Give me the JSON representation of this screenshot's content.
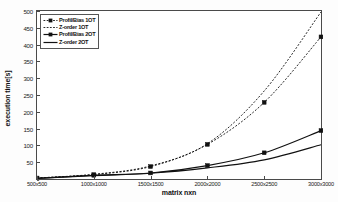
{
  "chart_data": {
    "type": "line",
    "title": "",
    "xlabel": "matrix nxn",
    "ylabel": "execution time[s]",
    "categories": [
      "500x500",
      "1000x1000",
      "1500x1500",
      "2000x2000",
      "2500x2500",
      "3000x3000"
    ],
    "x_values": [
      500,
      1000,
      1500,
      2000,
      2500,
      3000
    ],
    "ylim": [
      0,
      500
    ],
    "yticks": [
      0,
      50,
      100,
      150,
      200,
      250,
      300,
      350,
      400,
      450,
      500
    ],
    "ytick_labels": [
      "0",
      "50",
      "100",
      "150",
      "200",
      "250",
      "300",
      "350",
      "400",
      "450",
      "500"
    ],
    "grid": false,
    "legend_position": "upper-left",
    "series": [
      {
        "name": "Profil/Bias 1OT",
        "style": "dashed",
        "marker": "square",
        "color": "#111111",
        "values": [
          3,
          13,
          37,
          103,
          228,
          423
        ]
      },
      {
        "name": "Z-order 1OT",
        "style": "dashed",
        "marker": "none",
        "color": "#111111",
        "values": [
          3,
          14,
          39,
          105,
          262,
          497
        ]
      },
      {
        "name": "Profil/Bias 2OT",
        "style": "solid",
        "marker": "square",
        "color": "#111111",
        "values": [
          2,
          11,
          18,
          40,
          78,
          144
        ]
      },
      {
        "name": "Z-order 2OT",
        "style": "solid",
        "marker": "none",
        "color": "#111111",
        "values": [
          2,
          10,
          17,
          33,
          57,
          102
        ]
      }
    ]
  },
  "axis": {
    "y_label_text": "execution time[s]",
    "x_label_text": "matrix nxn"
  }
}
